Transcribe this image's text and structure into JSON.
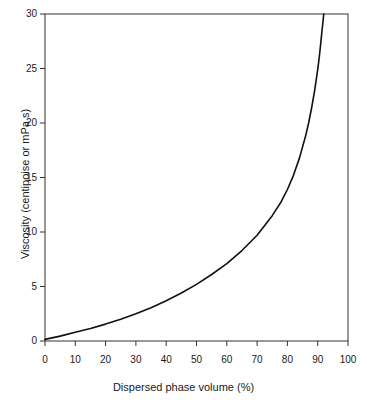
{
  "chart_data": {
    "type": "line",
    "title": "",
    "xlabel": "Dispersed phase volume (%)",
    "ylabel": "Viscosity (centipoise or mPa s)",
    "xlim": [
      0,
      100
    ],
    "ylim": [
      0,
      30
    ],
    "grid": false,
    "legend": null,
    "xticks": [
      0,
      10,
      20,
      30,
      40,
      50,
      60,
      70,
      80,
      90,
      100
    ],
    "xtick_labels": [
      "0",
      "10",
      "20",
      "30",
      "40",
      "50",
      "60",
      "70",
      "80",
      "90",
      "100"
    ],
    "yticks": [
      0,
      5,
      10,
      15,
      20,
      25,
      30
    ],
    "ytick_labels": [
      "0",
      "5",
      "10",
      "15",
      "20",
      "25",
      "30"
    ],
    "series": [
      {
        "name": "Viscosity vs dispersed phase volume",
        "color": "#111111",
        "linewidth": 1.6,
        "x": [
          0,
          5,
          10,
          15,
          20,
          25,
          30,
          35,
          40,
          45,
          50,
          55,
          60,
          65,
          70,
          75,
          78,
          80,
          82,
          84,
          86,
          87,
          88,
          89,
          90,
          90.5,
          91,
          91.4,
          91.7,
          92
        ],
        "y": [
          0.15,
          0.45,
          0.8,
          1.15,
          1.55,
          2.0,
          2.5,
          3.05,
          3.7,
          4.4,
          5.2,
          6.1,
          7.1,
          8.3,
          9.7,
          11.5,
          12.8,
          13.9,
          15.2,
          16.8,
          18.8,
          20.0,
          21.4,
          23.0,
          24.9,
          26.0,
          27.3,
          28.4,
          29.2,
          30.0
        ]
      }
    ]
  },
  "axes": {
    "x_title": "Dispersed phase volume (%)",
    "y_title": "Viscosity (centipoise or mPa s)"
  }
}
